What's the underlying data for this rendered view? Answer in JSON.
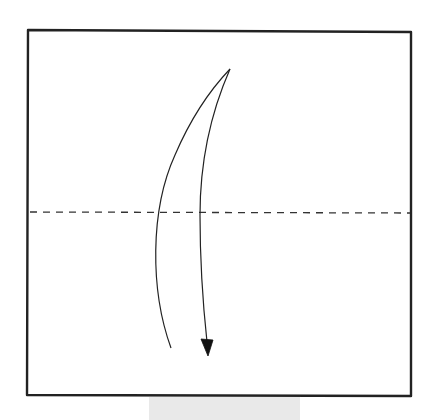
{
  "diagram": {
    "type": "origami-fold-step",
    "description": "Valley fold the square in half, folding the top edge down to the bottom edge",
    "paper": {
      "shape": "square",
      "fill": "#ffffff",
      "stroke": "#222222",
      "corners": {
        "top_left": [
          28,
          30
        ],
        "top_right": [
          411,
          32
        ],
        "bottom_right": [
          411,
          396
        ],
        "bottom_left": [
          27,
          395
        ]
      }
    },
    "fold_line": {
      "style": "dashed",
      "kind": "valley-fold",
      "y": 212,
      "x_start": 28,
      "x_end": 411,
      "dash": 7,
      "gap": 6,
      "color": "#333333"
    },
    "fold_arrow": {
      "direction": "down",
      "start": [
        171,
        348
      ],
      "apex": [
        230,
        69
      ],
      "end": [
        208,
        356
      ],
      "head": "filled-triangle",
      "color": "#222222"
    },
    "base_tab": {
      "color": "#e9e9e9"
    }
  }
}
